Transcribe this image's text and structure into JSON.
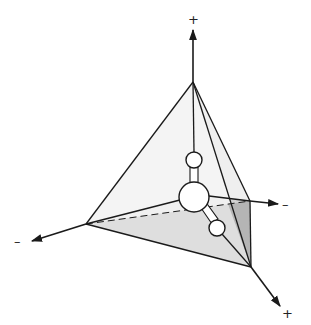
{
  "figure": {
    "type": "tetrahedral-molecule-diagram",
    "colors": {
      "line": "#1a1a1a",
      "face_light": "#f1f1f1",
      "face_mid": "#e4e4e4",
      "face_bottom": "#dcdcdc",
      "face_dark": "#b8b8b8",
      "atom_fill": "#ffffff"
    },
    "axes": [
      {
        "name": "z-axis",
        "direction": "up",
        "label": "+"
      },
      {
        "name": "x-axis-left",
        "direction": "lower-left",
        "label": "–"
      },
      {
        "name": "y-axis-right",
        "direction": "right",
        "label": "–"
      },
      {
        "name": "x-axis-right",
        "direction": "lower-right",
        "label": "+"
      }
    ],
    "atoms": [
      {
        "name": "central-atom",
        "size": "large"
      },
      {
        "name": "upper-ligand-atom",
        "size": "small"
      },
      {
        "name": "lower-ligand-atom",
        "size": "small"
      }
    ]
  }
}
